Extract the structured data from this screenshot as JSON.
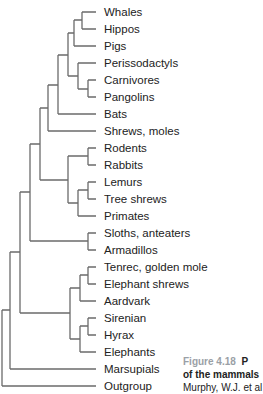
{
  "diagram": {
    "type": "phylogenetic-tree",
    "leaves": [
      "Whales",
      "Hippos",
      "Pigs",
      "Perissodactyls",
      "Carnivores",
      "Pangolins",
      "Bats",
      "Shrews, moles",
      "Rodents",
      "Rabbits",
      "Lemurs",
      "Tree shrews",
      "Primates",
      "Sloths, anteaters",
      "Armadillos",
      "Tenrec, golden mole",
      "Elephant shrews",
      "Aardvark",
      "Sirenian",
      "Hyrax",
      "Elephants",
      "Marsupials",
      "Outgroup"
    ],
    "line_color": "#6b6b6b"
  },
  "caption": {
    "figure_label": "Figure 4.18",
    "line1_tail": "P",
    "line2": "of the mammals",
    "line3": "Murphy, W.J. et al"
  }
}
